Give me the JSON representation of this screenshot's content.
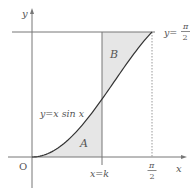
{
  "diagram": {
    "type": "function-area-plot",
    "function_label": "y=x sin x",
    "axis_labels": {
      "x": "x",
      "y": "y",
      "origin": "O"
    },
    "vertical_line_label": "x=k",
    "horizontal_line_label": {
      "lhs": "y=",
      "num": "π",
      "den": "2"
    },
    "xtick_label": {
      "num": "π",
      "den": "2"
    },
    "regions": [
      {
        "name": "A",
        "description": "area under curve from 0 to k"
      },
      {
        "name": "B",
        "description": "area above curve, below y=π/2, from k to π/2"
      }
    ],
    "colors": {
      "axis": "#666666",
      "curve": "#333333",
      "shade": "#e6e6e6",
      "text": "#555555"
    }
  }
}
